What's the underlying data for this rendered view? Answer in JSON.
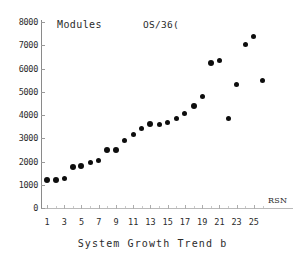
{
  "chart_data": {
    "type": "scatter",
    "title": "",
    "series_label": "Modules",
    "system_label": "OS/36(",
    "xlabel": "System Growth Trend b",
    "xlabel_truncated": true,
    "x_unit_label": "RSN",
    "ylabel": "",
    "xlim": [
      0,
      27
    ],
    "ylim": [
      0,
      8000
    ],
    "grid": false,
    "legend": "none",
    "y_ticks": [
      0,
      1000,
      2000,
      3000,
      4000,
      5000,
      6000,
      7000,
      8000
    ],
    "x_ticks": [
      1,
      3,
      5,
      7,
      9,
      11,
      13,
      15,
      17,
      19,
      21,
      23,
      25
    ],
    "x_minor_ticks": [
      2,
      4,
      6,
      8,
      10,
      12,
      14,
      16,
      18,
      20,
      22,
      24,
      26
    ],
    "point_color": "#0d0d0d",
    "axis_color": "#8a8a8a",
    "x": [
      1,
      2,
      3,
      4,
      5,
      6,
      7,
      8,
      9,
      10,
      11,
      12,
      13,
      14,
      15,
      16,
      17,
      18,
      19,
      20,
      21,
      22,
      23,
      24,
      25,
      26
    ],
    "values": [
      1200,
      1190,
      1280,
      1750,
      1790,
      1950,
      2050,
      2500,
      2500,
      2900,
      3150,
      3400,
      3620,
      3580,
      3690,
      3870,
      4050,
      4380,
      4780,
      6220,
      6350,
      3830,
      5320,
      7020,
      7370,
      5480
    ],
    "points": [
      {
        "x": 1,
        "y": 1200,
        "size": "big"
      },
      {
        "x": 2,
        "y": 1190,
        "size": "big"
      },
      {
        "x": 3,
        "y": 1280,
        "size": "normal"
      },
      {
        "x": 4,
        "y": 1750,
        "size": "big"
      },
      {
        "x": 5,
        "y": 1790,
        "size": "big"
      },
      {
        "x": 6,
        "y": 1950,
        "size": "normal"
      },
      {
        "x": 7,
        "y": 2050,
        "size": "normal"
      },
      {
        "x": 8,
        "y": 2500,
        "size": "big"
      },
      {
        "x": 9,
        "y": 2500,
        "size": "big"
      },
      {
        "x": 10,
        "y": 2900,
        "size": "normal"
      },
      {
        "x": 11,
        "y": 3150,
        "size": "normal"
      },
      {
        "x": 12,
        "y": 3400,
        "size": "normal"
      },
      {
        "x": 13,
        "y": 3620,
        "size": "big"
      },
      {
        "x": 14,
        "y": 3580,
        "size": "normal"
      },
      {
        "x": 15,
        "y": 3690,
        "size": "normal"
      },
      {
        "x": 16,
        "y": 3870,
        "size": "normal"
      },
      {
        "x": 17,
        "y": 4050,
        "size": "normal"
      },
      {
        "x": 18,
        "y": 4380,
        "size": "big"
      },
      {
        "x": 19,
        "y": 4780,
        "size": "normal"
      },
      {
        "x": 20,
        "y": 6220,
        "size": "big"
      },
      {
        "x": 21,
        "y": 6350,
        "size": "normal"
      },
      {
        "x": 22,
        "y": 3830,
        "size": "normal"
      },
      {
        "x": 23,
        "y": 5320,
        "size": "normal"
      },
      {
        "x": 24,
        "y": 7020,
        "size": "normal"
      },
      {
        "x": 25,
        "y": 7370,
        "size": "normal"
      },
      {
        "x": 26,
        "y": 5480,
        "size": "normal"
      }
    ]
  }
}
